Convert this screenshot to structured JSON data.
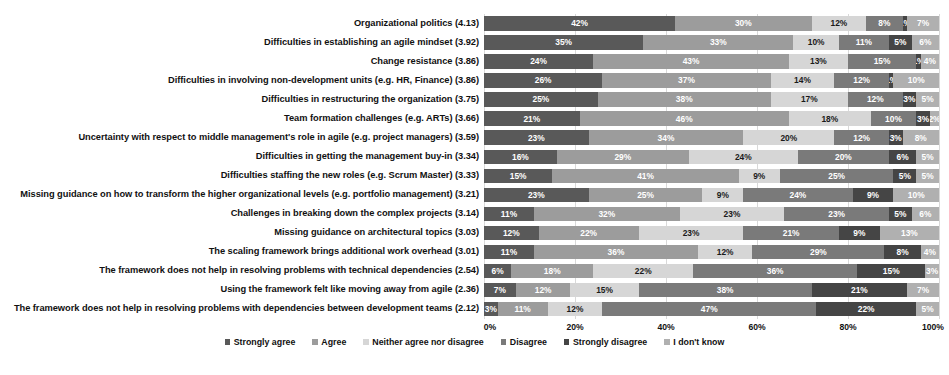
{
  "chart_data": {
    "type": "bar",
    "subtype": "100% stacked horizontal bar",
    "title": "",
    "xlabel": "",
    "ylabel": "",
    "xlim": [
      0,
      100
    ],
    "xticks": [
      "0%",
      "20%",
      "40%",
      "60%",
      "80%",
      "100%"
    ],
    "grid": true,
    "legend_position": "bottom",
    "series": [
      {
        "name": "Strongly agree",
        "color": "#595959",
        "values": [
          42,
          35,
          24,
          26,
          25,
          21,
          23,
          16,
          15,
          23,
          11,
          12,
          11,
          6,
          7,
          3
        ]
      },
      {
        "name": "Agree",
        "color": "#9c9c9c",
        "values": [
          30,
          33,
          43,
          37,
          38,
          46,
          34,
          29,
          41,
          25,
          32,
          22,
          36,
          18,
          12,
          11
        ]
      },
      {
        "name": "Neither agree nor disagree",
        "color": "#d6d6d6",
        "values": [
          12,
          10,
          13,
          14,
          17,
          18,
          20,
          24,
          9,
          9,
          23,
          23,
          12,
          22,
          15,
          12
        ]
      },
      {
        "name": "Disagree",
        "color": "#7a7a7a",
        "values": [
          8,
          11,
          15,
          12,
          12,
          10,
          12,
          20,
          25,
          24,
          23,
          21,
          29,
          36,
          38,
          47
        ]
      },
      {
        "name": "Strongly disagree",
        "color": "#454545",
        "values": [
          1,
          5,
          1,
          1,
          3,
          3,
          3,
          6,
          5,
          9,
          5,
          9,
          8,
          15,
          21,
          22
        ]
      },
      {
        "name": "I don't know",
        "color": "#b0b0b0",
        "values": [
          7,
          6,
          4,
          10,
          5,
          2,
          8,
          5,
          5,
          10,
          6,
          13,
          4,
          3,
          7,
          5
        ]
      }
    ],
    "categories": [
      "Organizational politics (4.13)",
      "Difficulties in establishing an agile mindset (3.92)",
      "Change resistance (3.86)",
      "Difficulties in involving non-development units (e.g. HR, Finance) (3.86)",
      "Difficulties in restructuring the organization (3.75)",
      "Team formation challenges (e.g. ARTs) (3.66)",
      "Uncertainty with respect to middle management's role in agile (e.g. project managers) (3.59)",
      "Difficulties in getting the management buy-in (3.34)",
      "Difficulties staffing the new roles (e.g. Scrum Master) (3.33)",
      "Missing guidance on how to transform the higher organizational levels (e.g. portfolio management) (3.21)",
      "Challenges in breaking down the complex projects (3.14)",
      "Missing guidance on architectural topics (3.03)",
      "The scaling framework brings additional work overhead (3.01)",
      "The framework does not help in resolving problems with technical dependencies (2.54)",
      "Using the framework felt like moving away from agile (2.36)",
      "The framework does not help in resolving problems with dependencies between development teams (2.12)"
    ],
    "rows": [
      {
        "label": "Organizational politics (4.13)",
        "values": [
          42,
          30,
          12,
          8,
          1,
          7
        ],
        "labels": [
          "42%",
          "30%",
          "12%",
          "8%",
          "1%",
          "7%"
        ]
      },
      {
        "label": "Difficulties in establishing an agile mindset (3.92)",
        "values": [
          35,
          33,
          10,
          11,
          5,
          6
        ],
        "labels": [
          "35%",
          "33%",
          "10%",
          "11%",
          "5%",
          "6%"
        ]
      },
      {
        "label": "Change resistance (3.86)",
        "values": [
          24,
          43,
          13,
          15,
          1,
          4
        ],
        "labels": [
          "24%",
          "43%",
          "13%",
          "15%",
          "1%",
          "4%"
        ]
      },
      {
        "label": "Difficulties in involving non-development units (e.g. HR, Finance) (3.86)",
        "values": [
          26,
          37,
          14,
          12,
          1,
          10
        ],
        "labels": [
          "26%",
          "37%",
          "14%",
          "12%",
          "1%",
          "10%"
        ]
      },
      {
        "label": "Difficulties in restructuring the organization (3.75)",
        "values": [
          25,
          38,
          17,
          12,
          3,
          5
        ],
        "labels": [
          "25%",
          "38%",
          "17%",
          "12%",
          "3%",
          "5%"
        ]
      },
      {
        "label": "Team formation challenges (e.g. ARTs) (3.66)",
        "values": [
          21,
          46,
          18,
          10,
          3,
          2
        ],
        "labels": [
          "21%",
          "46%",
          "18%",
          "10%",
          "3%",
          "2%"
        ]
      },
      {
        "label": "Uncertainty with respect to middle management's role in agile (e.g. project managers) (3.59)",
        "values": [
          23,
          34,
          20,
          12,
          3,
          8
        ],
        "labels": [
          "23%",
          "34%",
          "20%",
          "12%",
          "3%",
          "8%"
        ]
      },
      {
        "label": "Difficulties in getting the management buy-in (3.34)",
        "values": [
          16,
          29,
          24,
          20,
          6,
          5
        ],
        "labels": [
          "16%",
          "29%",
          "24%",
          "20%",
          "6%",
          "5%"
        ]
      },
      {
        "label": "Difficulties staffing the new roles (e.g. Scrum Master) (3.33)",
        "values": [
          15,
          41,
          9,
          25,
          5,
          5
        ],
        "labels": [
          "15%",
          "41%",
          "9%",
          "25%",
          "5%",
          "5%"
        ]
      },
      {
        "label": "Missing guidance on how to transform the higher organizational levels (e.g. portfolio management) (3.21)",
        "values": [
          23,
          25,
          9,
          24,
          9,
          10
        ],
        "labels": [
          "23%",
          "25%",
          "9%",
          "24%",
          "9%",
          "10%"
        ]
      },
      {
        "label": "Challenges in breaking down the complex projects (3.14)",
        "values": [
          11,
          32,
          23,
          23,
          5,
          6
        ],
        "labels": [
          "11%",
          "32%",
          "23%",
          "23%",
          "5%",
          "6%"
        ]
      },
      {
        "label": "Missing guidance on architectural topics (3.03)",
        "values": [
          12,
          22,
          23,
          21,
          9,
          13
        ],
        "labels": [
          "12%",
          "22%",
          "23%",
          "21%",
          "9%",
          "13%"
        ]
      },
      {
        "label": "The scaling framework brings additional work overhead (3.01)",
        "values": [
          11,
          36,
          12,
          29,
          8,
          4
        ],
        "labels": [
          "11%",
          "36%",
          "12%",
          "29%",
          "8%",
          "4%"
        ]
      },
      {
        "label": "The framework does not help in resolving problems with technical dependencies (2.54)",
        "values": [
          6,
          18,
          22,
          36,
          15,
          3
        ],
        "labels": [
          "6%",
          "18%",
          "22%",
          "36%",
          "15%",
          "3%"
        ]
      },
      {
        "label": "Using the framework felt like moving away from agile (2.36)",
        "values": [
          7,
          12,
          15,
          38,
          21,
          7
        ],
        "labels": [
          "7%",
          "12%",
          "15%",
          "38%",
          "21%",
          "7%"
        ]
      },
      {
        "label": "The framework does not help in resolving problems with dependencies between development teams (2.12)",
        "values": [
          3,
          11,
          12,
          47,
          22,
          5
        ],
        "labels": [
          "3%",
          "11%",
          "12%",
          "47%",
          "22%",
          "5%"
        ]
      }
    ]
  }
}
